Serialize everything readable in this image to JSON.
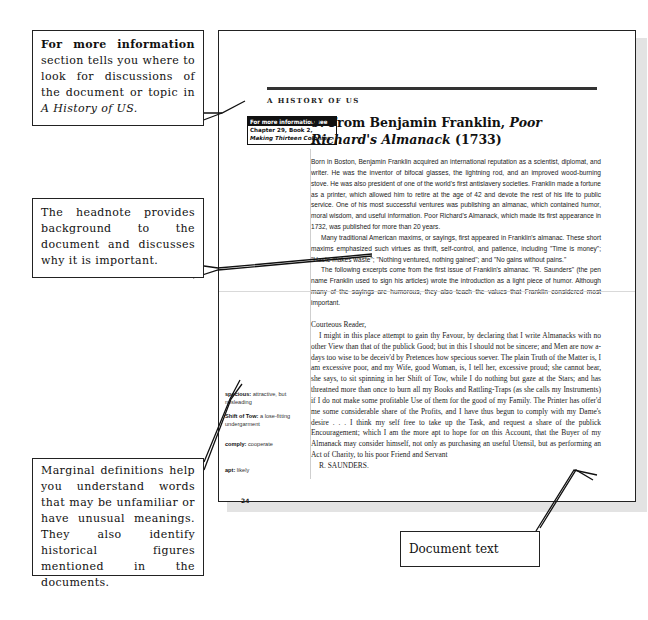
{
  "page": {
    "running_head": "A HISTORY OF US",
    "page_number": "24",
    "info_box": {
      "heading": "For more information see",
      "body_plain": "Chapter 29, Book 2, ",
      "body_italic": "Making Thirteen Colonies."
    },
    "document_title": {
      "prefix": "9. From Benjamin Franklin, ",
      "italic": "Poor Richard's Almanack",
      "suffix": " (1733)"
    },
    "headnote": [
      "Born in Boston, Benjamin Franklin acquired an international reputation as a scientist, diplomat, and writer. He was the inventor of bifocal glasses, the lightning rod, and an improved wood-burning stove. He was also president of one of the world's first antislavery societies. Franklin made a fortune as a printer, which allowed him to retire at the age of 42 and devote the rest of his life to public service. One of his most successful ventures was publishing an almanac, which contained humor, moral wisdom, and useful information. Poor Richard's Almanack, which made its first appearance in 1732, was published for more than 20 years.",
      "Many traditional American maxims, or sayings, first appeared in Franklin's almanac. These short maxims emphasized such virtues as thrift, self-control, and patience, including \"Time is money\"; \"Haste makes waste\"; \"Nothing ventured, nothing gained\"; and \"No gains without pains.\"",
      "The following excerpts come from the first issue of Franklin's almanac. \"R. Saunders\" (the pen name Franklin used to sign his articles) wrote the introduction as a light piece of humor. Although many of the sayings are humorous, they also teach the values that Franklin considered most important."
    ],
    "document_text": {
      "salutation": "Courteous Reader,",
      "body": "I might in this place attempt to gain thy Favour, by declaring that I write Almanacks with no other View than that of the publick Good; but in this I should not be sincere; and Men are now a-days too wise to be deceiv'd by Pretences how specious soever. The plain Truth of the Matter is, I am excessive poor, and my Wife, good Woman, is, I tell her, excessive proud; she cannot bear, she says, to sit spinning in her Shift of Tow, while I do nothing but gaze at the Stars; and has threatned more than once to burn all my Books and Rattling-Traps (as she calls my Instruments) if I do not make some profitable Use of them for the good of my Family. The Printer has offer'd me some considerable share of the Profits, and I have thus begun to comply with my Dame's desire . . . I think my self free to take up the Task, and request a share of the publick Encouragement; which I am the more apt to hope for on this Account, that the Buyer of my Almanack may consider himself, not only as purchasing an useful Utensil, but as performing an Act of Charity, to his poor Friend and Servant",
      "signature": "R. SAUNDERS."
    },
    "margin_definitions": [
      {
        "term": "specious:",
        "definition": " attractive, but misleading"
      },
      {
        "term": "Shift of Tow:",
        "definition": " a lose-fitting undergarment"
      },
      {
        "term": "comply:",
        "definition": " cooperate"
      },
      {
        "term": "apt:",
        "definition": " likely"
      }
    ]
  },
  "callouts": {
    "more_info": {
      "bold": "For more information",
      "text": " section tells you where to look for discussions of the document or topic in ",
      "italic": "A History of US."
    },
    "headnote": {
      "text": "The headnote provides background to the document and discusses why it is important."
    },
    "definitions": {
      "text": "Marginal definitions help you understand words that may be unfamiliar or have unusual meanings. They also identify historical figures mentioned in the documents."
    },
    "document_text": {
      "text": "Document text"
    }
  }
}
